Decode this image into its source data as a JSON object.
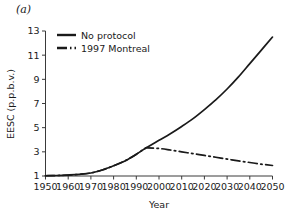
{
  "figure": {
    "panel_label": "(a)",
    "background_color": "#ffffff",
    "line_color": "#1a1a1a"
  },
  "chart_data": {
    "type": "line",
    "title": "",
    "xlabel": "Year",
    "ylabel": "EESC (p.p.b.v.)",
    "xlim": [
      1950,
      2050
    ],
    "ylim": [
      1,
      13
    ],
    "xticks": [
      1950,
      1960,
      1970,
      1980,
      1990,
      2000,
      2010,
      2020,
      2030,
      2040,
      2050
    ],
    "xtick_labels": [
      "1950",
      "1960",
      "1970",
      "1980",
      "1990",
      "2000",
      "2010",
      "2020",
      "2030",
      "2040",
      "2050"
    ],
    "yticks": [
      1,
      3,
      5,
      7,
      9,
      11,
      13
    ],
    "ytick_labels": [
      "1",
      "3",
      "5",
      "7",
      "9",
      "11",
      "13"
    ],
    "grid": false,
    "legend_position": "upper left",
    "series": [
      {
        "name": "No protocol",
        "style": "solid",
        "x": [
          1950,
          1955,
          1960,
          1965,
          1970,
          1975,
          1980,
          1985,
          1990,
          1994,
          1995,
          2000,
          2005,
          2010,
          2015,
          2020,
          2025,
          2030,
          2035,
          2040,
          2045,
          2050
        ],
        "values": [
          1.02,
          1.04,
          1.08,
          1.14,
          1.25,
          1.5,
          1.85,
          2.25,
          2.8,
          3.3,
          3.4,
          3.95,
          4.5,
          5.1,
          5.75,
          6.5,
          7.3,
          8.2,
          9.2,
          10.3,
          11.4,
          12.5
        ]
      },
      {
        "name": "1997 Montreal",
        "style": "dashdot",
        "x": [
          1950,
          1955,
          1960,
          1965,
          1970,
          1975,
          1980,
          1985,
          1990,
          1994,
          1995,
          2000,
          2005,
          2010,
          2015,
          2020,
          2025,
          2030,
          2035,
          2040,
          2045,
          2050
        ],
        "values": [
          1.02,
          1.04,
          1.08,
          1.14,
          1.25,
          1.5,
          1.85,
          2.25,
          2.8,
          3.3,
          3.32,
          3.28,
          3.15,
          3.0,
          2.85,
          2.7,
          2.55,
          2.4,
          2.25,
          2.12,
          1.98,
          1.87
        ]
      }
    ],
    "legend": [
      {
        "label": "No protocol",
        "style": "solid"
      },
      {
        "label": "1997 Montreal",
        "style": "dashdot"
      }
    ]
  }
}
